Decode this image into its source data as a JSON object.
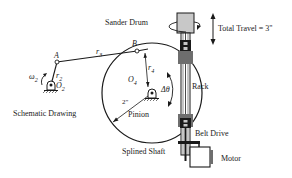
{
  "labels": {
    "sander_drum": "Sander Drum",
    "total_travel": "Total Travel = 3\"",
    "rack": "Rack",
    "belt_drive": "Belt Drive",
    "splined_shaft": "Splined Shaft",
    "motor": "Motor",
    "schematic_drawing": "Schematic Drawing",
    "pinion": "Pinion",
    "point_a": "A",
    "point_b": "B",
    "r2": "r",
    "r2_sub": "2",
    "r3": "r",
    "r3_sub": "3",
    "r4": "r",
    "r4_sub": "4",
    "o2": "O",
    "o2_sub": "2",
    "o4": "O",
    "o4_sub": "4",
    "omega2": "ω",
    "omega2_sub": "2",
    "delta_theta": "Δθ",
    "radius_2in": "2\""
  },
  "colors": {
    "line": "#1a1a1a",
    "drum_fill": "#c8c8c8",
    "clamp_fill": "#6e6e6e",
    "background": "#ffffff"
  }
}
